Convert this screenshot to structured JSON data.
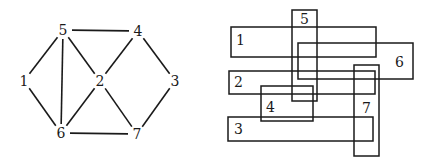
{
  "graph": {
    "nodes": [
      {
        "id": "1",
        "x": 24,
        "y": 81
      },
      {
        "id": "2",
        "x": 100,
        "y": 81
      },
      {
        "id": "3",
        "x": 175,
        "y": 81
      },
      {
        "id": "4",
        "x": 138,
        "y": 31
      },
      {
        "id": "5",
        "x": 63,
        "y": 30
      },
      {
        "id": "6",
        "x": 61,
        "y": 133
      },
      {
        "id": "7",
        "x": 137,
        "y": 134
      }
    ],
    "edges": [
      [
        "5",
        "4"
      ],
      [
        "5",
        "1"
      ],
      [
        "5",
        "6"
      ],
      [
        "5",
        "2"
      ],
      [
        "4",
        "2"
      ],
      [
        "4",
        "3"
      ],
      [
        "1",
        "6"
      ],
      [
        "2",
        "6"
      ],
      [
        "2",
        "7"
      ],
      [
        "6",
        "7"
      ],
      [
        "3",
        "7"
      ]
    ]
  },
  "rectangles": [
    {
      "id": "1",
      "x": 231,
      "y": 27,
      "w": 145,
      "h": 30,
      "lx": 236,
      "ly": 45
    },
    {
      "id": "2",
      "x": 229,
      "y": 71,
      "w": 146,
      "h": 23,
      "lx": 234,
      "ly": 87
    },
    {
      "id": "3",
      "x": 228,
      "y": 117,
      "w": 145,
      "h": 24,
      "lx": 234,
      "ly": 134
    },
    {
      "id": "4",
      "x": 261,
      "y": 86,
      "w": 52,
      "h": 35,
      "lx": 266,
      "ly": 112
    },
    {
      "id": "5",
      "x": 292,
      "y": 10,
      "w": 25,
      "h": 91,
      "lx": 300,
      "ly": 24
    },
    {
      "id": "6",
      "x": 298,
      "y": 43,
      "w": 115,
      "h": 36,
      "lx": 395,
      "ly": 67
    },
    {
      "id": "7",
      "x": 354,
      "y": 65,
      "w": 25,
      "h": 91,
      "lx": 362,
      "ly": 113
    }
  ]
}
